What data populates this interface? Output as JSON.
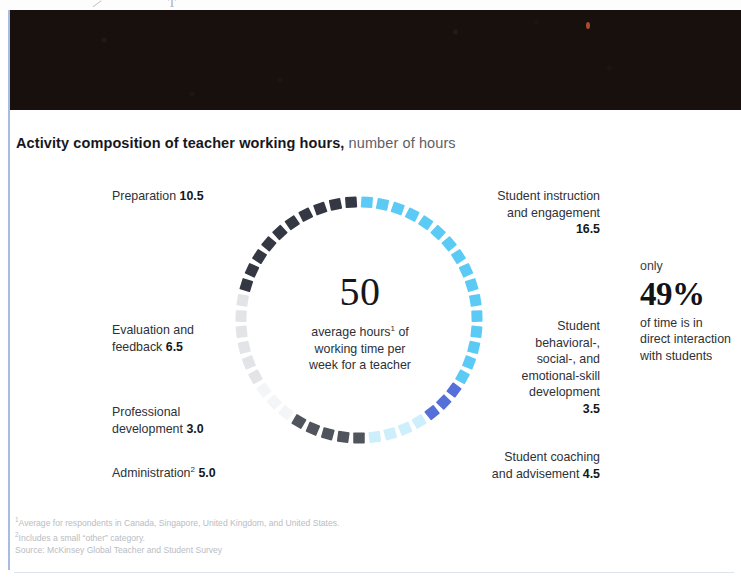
{
  "header": {
    "title_strong": "Activity composition of teacher working hours,",
    "title_sub": " number of hours"
  },
  "center": {
    "value": "50",
    "caption_line1_a": "average hours",
    "caption_line1_sup": "1",
    "caption_line1_b": " of",
    "caption_line2": "working time per",
    "caption_line3": "week for a teacher"
  },
  "labels": {
    "preparation": {
      "text": "Preparation ",
      "value": "10.5"
    },
    "evaluation": {
      "line1": "Evaluation and",
      "line2": "feedback ",
      "value": "6.5"
    },
    "professional": {
      "line1": "Professional",
      "line2": "development ",
      "value": "3.0"
    },
    "administration": {
      "text": "Administration",
      "sup": "2",
      "value": "5.0"
    },
    "instruction": {
      "line1": "Student instruction",
      "line2": "and engagement",
      "value": "16.5"
    },
    "behavioral": {
      "line1": "Student",
      "line2": "behavioral-,",
      "line3": "social-, and",
      "line4": "emotional-skill",
      "line5": "development",
      "value": "3.5"
    },
    "coaching": {
      "line1": "Student coaching",
      "line2": "and advisement ",
      "value": "4.5"
    }
  },
  "stat_callout": {
    "kicker": "only",
    "value": "49%",
    "desc_line1": "of time is in",
    "desc_line2": "direct interaction",
    "desc_line3": "with students"
  },
  "footnotes": {
    "note1_sup": "1",
    "note1": "Average for respondents in Canada, Singapore, United Kingdom, and United States.",
    "note2_sup": "2",
    "note2": "Includes a small “other” category.",
    "source": "Source: McKinsey Global Teacher and Student Survey"
  },
  "chart_data": {
    "type": "pie",
    "title": "Activity composition of teacher working hours, number of hours",
    "subtitle": "number of hours",
    "total": 50,
    "total_label": "average hours of working time per week for a teacher",
    "units": "hours per week",
    "style": "segmented donut (tick marks), starts at 12 o'clock, clockwise",
    "legend": "direct labels around ring",
    "grid": false,
    "categories": [
      "Student instruction and engagement",
      "Student behavioral-, social-, and emotional-skill development",
      "Student coaching and advisement",
      "Administration",
      "Professional development",
      "Evaluation and feedback",
      "Preparation"
    ],
    "values": [
      16.5,
      3.5,
      4.5,
      5.0,
      3.0,
      6.5,
      10.5
    ],
    "colors": [
      "#5bcbf5",
      "#5570d8",
      "#cdeefb",
      "#4f545d",
      "#f4f5f7",
      "#e2e4e8",
      "#343842"
    ],
    "ticks_per_segment": [
      16,
      3,
      4,
      5,
      3,
      6,
      10
    ],
    "highlight": {
      "label": "only 49% of time is in direct interaction with students",
      "percent": 49,
      "hours": 24.5,
      "components": [
        "Student instruction and engagement",
        "Student behavioral-, social-, and emotional-skill development",
        "Student coaching and advisement"
      ]
    },
    "colors_meta": {
      "student_light_blue": "#5bcbf5",
      "student_medium_blue": "#5570d8",
      "student_pale_blue": "#cdeefb",
      "dark_charcoal": "#343842",
      "mid_gray": "#4f545d",
      "light_gray": "#e2e4e8",
      "near_white": "#f4f5f7"
    }
  }
}
